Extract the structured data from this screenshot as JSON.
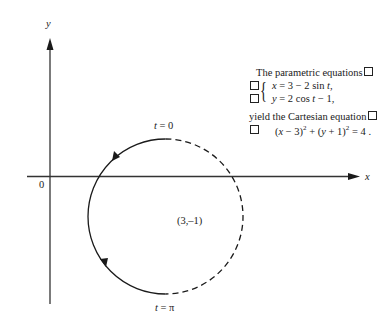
{
  "axes": {
    "x_label": "x",
    "y_label": "y",
    "origin_label": "0"
  },
  "circle": {
    "center_label": "(3,–1)",
    "start_label_t": "t",
    "start_label_eq": "= 0",
    "end_label_t": "t",
    "end_label_eq": "= π"
  },
  "annotation": {
    "line1": "The parametric equations",
    "eq_x_var": "x",
    "eq_x_rest": " = 3 − 2 sin ",
    "eq_x_t": "t",
    "eq_x_end": ",",
    "eq_y_var": "y",
    "eq_y_rest": " = 2 cos ",
    "eq_y_t": "t",
    "eq_y_end": " − 1,",
    "line4": "yield the Cartesian equation",
    "cart_part1": "(",
    "cart_x": "x",
    "cart_part2": " − 3)",
    "cart_exp1": "2",
    "cart_part3": " + (",
    "cart_y": "y",
    "cart_part4": " + 1)",
    "cart_exp2": "2",
    "cart_part5": " = 4 ."
  },
  "colors": {
    "stroke": "#1a1a1a",
    "background": "#ffffff"
  }
}
